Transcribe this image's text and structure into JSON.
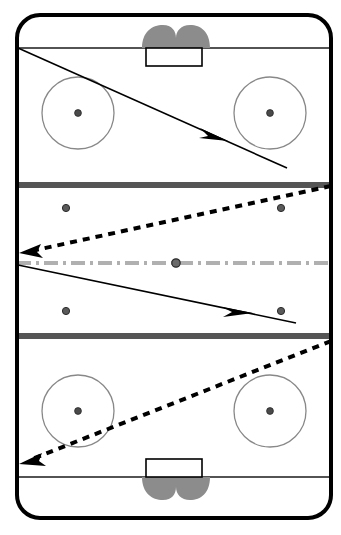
{
  "diagram": {
    "type": "hockey-rink-play-diagram",
    "width": 341,
    "height": 535
  },
  "colors": {
    "background": "#ffffff",
    "boards": "#000000",
    "goal_line": "#1a1a1a",
    "blue_line": "#555555",
    "center_line": "#b0b0b0",
    "faceoff_circle": "#888888",
    "faceoff_dot": "#444444",
    "crease": "#8c8c8c",
    "net": "#ffffff",
    "net_outline": "#000000",
    "solid_path": "#000000",
    "dashed_path": "#000000"
  },
  "rink": {
    "label": "ice-surface",
    "left": 17,
    "top": 15,
    "right": 331,
    "bottom": 518,
    "corner_radius": 23,
    "border_width": 4
  },
  "zones": [
    {
      "name": "attacking-zone-top",
      "top": 15,
      "bottom": 184
    },
    {
      "name": "neutral-zone",
      "top": 184,
      "bottom": 337
    },
    {
      "name": "defending-zone-bottom",
      "top": 337,
      "bottom": 518
    }
  ],
  "lines": {
    "goal_lines": [
      {
        "name": "goal-line-top",
        "y": 48,
        "x1": 17,
        "x2": 331,
        "color": "#1a1a1a",
        "width": 1.6
      },
      {
        "name": "goal-line-bottom",
        "y": 477,
        "x1": 17,
        "x2": 331,
        "color": "#1a1a1a",
        "width": 1.6
      }
    ],
    "blue_lines": [
      {
        "name": "blue-line-top",
        "y": 185,
        "x1": 17,
        "x2": 331,
        "color": "#555555",
        "width": 6
      },
      {
        "name": "blue-line-bottom",
        "y": 336,
        "x1": 17,
        "x2": 331,
        "color": "#555555",
        "width": 6
      }
    ],
    "center_line": {
      "name": "center-red-line",
      "y": 263,
      "x1": 17,
      "x2": 341,
      "color": "#b0b0b0",
      "width": 4,
      "dash_pattern": "14 5 3 5"
    }
  },
  "goals": [
    {
      "name": "goal-top",
      "net": {
        "x": 146,
        "y": 48,
        "width": 56,
        "height": 18
      },
      "crease": {
        "cx": 174,
        "cy": 42,
        "rx": 36,
        "ry": 15
      }
    },
    {
      "name": "goal-bottom",
      "net": {
        "x": 146,
        "y": 459,
        "width": 56,
        "height": 18
      },
      "crease": {
        "cx": 174,
        "cy": 484,
        "rx": 36,
        "ry": 15
      }
    }
  ],
  "faceoff_circles": [
    {
      "name": "faceoff-circle-top-left",
      "cx": 78,
      "cy": 113,
      "r": 36
    },
    {
      "name": "faceoff-circle-top-right",
      "cx": 270,
      "cy": 113,
      "r": 36
    },
    {
      "name": "faceoff-circle-bottom-left",
      "cx": 78,
      "cy": 411,
      "r": 36
    },
    {
      "name": "faceoff-circle-bottom-right",
      "cx": 270,
      "cy": 411,
      "r": 36
    }
  ],
  "faceoff_dots": [
    {
      "name": "faceoff-dot-top-left",
      "cx": 78,
      "cy": 113,
      "r": 3.4
    },
    {
      "name": "faceoff-dot-top-right",
      "cx": 270,
      "cy": 113,
      "r": 3.4
    },
    {
      "name": "faceoff-dot-bottom-left",
      "cx": 78,
      "cy": 411,
      "r": 3.4
    },
    {
      "name": "faceoff-dot-bottom-right",
      "cx": 270,
      "cy": 411,
      "r": 3.4
    },
    {
      "name": "faceoff-dot-neutral-top-left",
      "cx": 66,
      "cy": 208,
      "r": 3.6
    },
    {
      "name": "faceoff-dot-neutral-top-right",
      "cx": 281,
      "cy": 208,
      "r": 3.6
    },
    {
      "name": "faceoff-dot-neutral-bottom-left",
      "cx": 66,
      "cy": 311,
      "r": 3.6
    },
    {
      "name": "faceoff-dot-neutral-bottom-right",
      "cx": 281,
      "cy": 311,
      "r": 3.6
    },
    {
      "name": "faceoff-dot-center",
      "cx": 176,
      "cy": 263,
      "r": 4.2
    }
  ],
  "paths": [
    {
      "name": "pass-path-1-solid",
      "style": "solid",
      "description": "Solid line from top-left goal line corner diagonally down-right into the top zone",
      "points": [
        [
          18,
          48
        ],
        [
          287,
          168
        ]
      ],
      "arrow_at": [
        218,
        136
      ],
      "arrow_angle": 24,
      "color": "#000000",
      "width": 1.6
    },
    {
      "name": "pass-path-2-dashed",
      "style": "dashed",
      "description": "Dashed line from top-right corner of neutral zone to the left boards at center-line height",
      "points": [
        [
          331,
          186
        ],
        [
          22,
          253
        ]
      ],
      "arrow_at": [
        24,
        252
      ],
      "arrow_angle": 192,
      "color": "#000000",
      "width": 4,
      "dash_pattern": "7 6"
    },
    {
      "name": "pass-path-3-solid",
      "style": "solid",
      "description": "Solid line from left boards at center-line height down-right to the lower blue line",
      "points": [
        [
          18,
          265
        ],
        [
          296,
          323
        ]
      ],
      "arrow_at": [
        243,
        312
      ],
      "arrow_angle": 12,
      "color": "#000000",
      "width": 1.6
    },
    {
      "name": "pass-path-4-dashed",
      "style": "dashed",
      "description": "Dashed line from lower blue line at right boards down-left to the bottom-left goal line corner",
      "points": [
        [
          331,
          341
        ],
        [
          22,
          463
        ]
      ],
      "arrow_at": [
        24,
        462
      ],
      "arrow_angle": 202,
      "color": "#000000",
      "width": 4,
      "dash_pattern": "7 6"
    }
  ],
  "legend": {
    "solid_meaning": "skating / carry path",
    "dashed_meaning": "pass path"
  }
}
